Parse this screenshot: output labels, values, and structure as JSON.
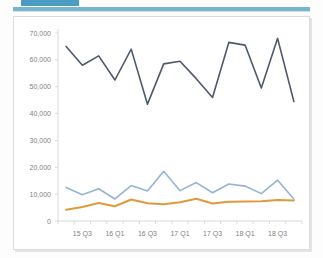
{
  "window": {
    "tab_stub_color": "#4a9cc2",
    "rule_bar_color": "#76b5ce"
  },
  "panel": {
    "background": "#ffffff",
    "border_color": "#dcdcdc"
  },
  "chart_data": {
    "type": "line",
    "title": "",
    "subtitle": "",
    "xlabel": "",
    "ylabel": "",
    "grid": false,
    "legend": "none",
    "ylim": [
      0,
      70000
    ],
    "ytick_values": [
      0,
      10000,
      20000,
      30000,
      40000,
      50000,
      60000,
      70000
    ],
    "ytick_labels": [
      "0",
      "10,000",
      "20,000",
      "30,000",
      "40,000",
      "50,000",
      "60,000",
      "70,000"
    ],
    "categories": [
      "15 Q2",
      "15 Q3",
      "15 Q4",
      "16 Q1",
      "16 Q2",
      "16 Q3",
      "16 Q4",
      "17 Q1",
      "17 Q2",
      "17 Q3",
      "17 Q4",
      "18 Q1",
      "18 Q2",
      "18 Q3",
      "18 Q4"
    ],
    "xtick_labels_shown": [
      "15 Q3",
      "16 Q1",
      "16 Q3",
      "17 Q1",
      "17 Q3",
      "18 Q1",
      "18 Q3"
    ],
    "xtick_label_indices": [
      1,
      3,
      5,
      7,
      9,
      11,
      13
    ],
    "series": [
      {
        "name": "series-dark",
        "color": "#4d5a69",
        "width": 1.6,
        "values": [
          65000,
          58000,
          61500,
          52500,
          64000,
          43500,
          58500,
          59500,
          53000,
          46000,
          66500,
          65500,
          49500,
          68000,
          44500
        ]
      },
      {
        "name": "series-light-blue",
        "color": "#95b3d7",
        "width": 1.6,
        "values": [
          12500,
          9800,
          12000,
          8200,
          13200,
          11200,
          18500,
          11300,
          14300,
          10500,
          13800,
          13000,
          10200,
          15200,
          8200
        ]
      },
      {
        "name": "series-orange",
        "color": "#e09a3c",
        "width": 2.0,
        "values": [
          4200,
          5200,
          6700,
          5500,
          8000,
          6600,
          6200,
          7000,
          8300,
          6500,
          7200,
          7300,
          7400,
          7800,
          7600
        ]
      }
    ]
  }
}
